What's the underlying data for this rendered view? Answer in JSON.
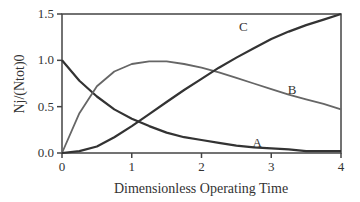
{
  "chart_data": {
    "type": "line",
    "title": "",
    "xlabel": "Dimensionless Operating Time",
    "ylabel": "Nj/(Ntot)0",
    "xlim": [
      0,
      4
    ],
    "ylim": [
      0,
      1.5
    ],
    "x_ticks": [
      "0",
      "1",
      "2",
      "3",
      "4"
    ],
    "y_ticks": [
      "0.0",
      "0.5",
      "1.0",
      "1.5"
    ],
    "grid": false,
    "legend": "inline labels",
    "x": [
      0,
      0.25,
      0.5,
      0.75,
      1,
      1.25,
      1.5,
      1.75,
      2,
      2.25,
      2.5,
      2.75,
      3,
      3.25,
      3.5,
      3.75,
      4
    ],
    "series": [
      {
        "name": "A",
        "color": "#333333",
        "values": [
          1.0,
          0.78,
          0.61,
          0.47,
          0.37,
          0.29,
          0.22,
          0.17,
          0.14,
          0.11,
          0.08,
          0.06,
          0.05,
          0.04,
          0.02,
          0.02,
          0.02
        ]
      },
      {
        "name": "B",
        "color": "#666666",
        "values": [
          0.0,
          0.43,
          0.72,
          0.88,
          0.96,
          0.99,
          0.99,
          0.96,
          0.92,
          0.87,
          0.81,
          0.75,
          0.69,
          0.63,
          0.58,
          0.53,
          0.47
        ]
      },
      {
        "name": "C",
        "color": "#333333",
        "values": [
          0.0,
          0.02,
          0.07,
          0.17,
          0.29,
          0.42,
          0.55,
          0.68,
          0.8,
          0.92,
          1.03,
          1.13,
          1.23,
          1.31,
          1.38,
          1.44,
          1.5
        ]
      }
    ],
    "annotations": [
      {
        "text": "A",
        "x": 2.8,
        "y": 0.07
      },
      {
        "text": "B",
        "x": 3.3,
        "y": 0.64
      },
      {
        "text": "C",
        "x": 2.6,
        "y": 1.32
      }
    ]
  }
}
